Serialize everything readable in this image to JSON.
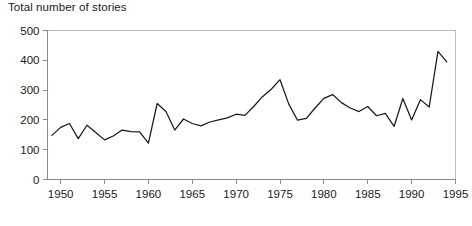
{
  "chart_data": {
    "type": "line",
    "title": "Total number of stories",
    "xlabel": "",
    "ylabel": "",
    "grid": false,
    "legend": null,
    "xlim": [
      1948.5,
      1995
    ],
    "ylim": [
      0,
      500
    ],
    "y_ticks": [
      0,
      100,
      200,
      300,
      400,
      500
    ],
    "y_tick_labels": [
      "0",
      "100",
      "200",
      "300",
      "400",
      "500"
    ],
    "x_ticks": [
      1950,
      1955,
      1960,
      1965,
      1970,
      1975,
      1980,
      1985,
      1990,
      1995
    ],
    "x_tick_labels": [
      "1950",
      "1955",
      "1960",
      "1965",
      "1970",
      "1975",
      "1980",
      "1985",
      "1990",
      "1995"
    ],
    "x": [
      1949,
      1950,
      1951,
      1952,
      1953,
      1954,
      1955,
      1956,
      1957,
      1958,
      1959,
      1960,
      1961,
      1962,
      1963,
      1964,
      1965,
      1966,
      1967,
      1968,
      1969,
      1970,
      1971,
      1972,
      1973,
      1974,
      1975,
      1976,
      1977,
      1978,
      1979,
      1980,
      1981,
      1982,
      1983,
      1984,
      1985,
      1986,
      1987,
      1988,
      1989,
      1990,
      1991,
      1992,
      1993,
      1994
    ],
    "values": [
      148,
      175,
      188,
      137,
      182,
      158,
      133,
      146,
      166,
      161,
      160,
      122,
      255,
      228,
      166,
      203,
      188,
      180,
      193,
      200,
      207,
      219,
      215,
      245,
      278,
      303,
      335,
      253,
      199,
      205,
      240,
      272,
      285,
      258,
      240,
      228,
      245,
      214,
      222,
      178,
      272,
      200,
      268,
      243,
      430,
      395
    ],
    "series": [
      {
        "name": "Total number of stories",
        "values": [
          148,
          175,
          188,
          137,
          182,
          158,
          133,
          146,
          166,
          161,
          160,
          122,
          255,
          228,
          166,
          203,
          188,
          180,
          193,
          200,
          207,
          219,
          215,
          245,
          278,
          303,
          335,
          253,
          199,
          205,
          240,
          272,
          285,
          258,
          240,
          228,
          245,
          214,
          222,
          178,
          272,
          200,
          268,
          243,
          430,
          395
        ]
      }
    ],
    "line_color": "#1a1a1a",
    "axis_color": "#8a8a8a"
  }
}
